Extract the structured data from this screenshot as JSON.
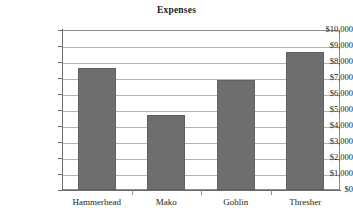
{
  "chart_data": {
    "type": "bar",
    "title": "Expenses",
    "xlabel": "",
    "ylabel": "",
    "categories": [
      "Hammerhead",
      "Mako",
      "Goblin",
      "Thresher"
    ],
    "values": [
      7625,
      4700,
      6875,
      8650
    ],
    "ylim": [
      0,
      10000
    ],
    "ytick_step": 1000,
    "ytick_labels": [
      "$10,000",
      "$9,000",
      "$8,000",
      "$7,000",
      "$6,000",
      "$5,000",
      "$4,000",
      "$3,000",
      "$2,000",
      "$1,000",
      "$0"
    ],
    "grid": true,
    "legend": false,
    "bar_color": "#6e6e6e",
    "bar_border_color": "#606060",
    "gridline_color": "#b3b3b3",
    "axis_color": "#6b6b6b",
    "plot_border_color": "#8c8c8c",
    "background_color": "#ffffff"
  }
}
